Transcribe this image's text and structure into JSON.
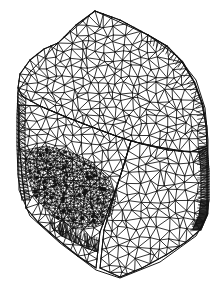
{
  "figure": {
    "kind": "3d-surface-mesh-wireframe",
    "title": "",
    "caption": "",
    "background_color": "#ffffff",
    "line_color": "#111111",
    "width_px": 224,
    "height_px": 292
  },
  "chart_data": {
    "type": "mesh",
    "title": "",
    "xlabel": "",
    "ylabel": "",
    "projection": "isometric",
    "element_type": "triangle",
    "render_style": "wireframe",
    "regions": [
      {
        "name": "top-face",
        "density": "medium",
        "label": ""
      },
      {
        "name": "front-left-face",
        "density": "medium",
        "label": ""
      },
      {
        "name": "front-right-face",
        "density": "medium",
        "label": ""
      },
      {
        "name": "right-curved-edge-band",
        "density": "high",
        "label": ""
      },
      {
        "name": "left-side-band",
        "density": "high",
        "label": ""
      },
      {
        "name": "refinement-zone-lower-left",
        "density": "very-high",
        "label": ""
      }
    ],
    "silhouette": [
      [
        95,
        11
      ],
      [
        148,
        35
      ],
      [
        178,
        57
      ],
      [
        196,
        80
      ],
      [
        205,
        108
      ],
      [
        208,
        140
      ],
      [
        208,
        214
      ],
      [
        196,
        236
      ],
      [
        160,
        262
      ],
      [
        120,
        278
      ],
      [
        96,
        270
      ],
      [
        60,
        243
      ],
      [
        30,
        216
      ],
      [
        19,
        190
      ],
      [
        18,
        92
      ],
      [
        30,
        72
      ],
      [
        58,
        43
      ]
    ],
    "seed_counts": {
      "top_face_nodes": 180,
      "front_left_nodes": 150,
      "front_right_nodes": 140,
      "refinement_nodes": 220
    },
    "stroke_width_px": 0.85,
    "grid": false,
    "legend": null
  }
}
